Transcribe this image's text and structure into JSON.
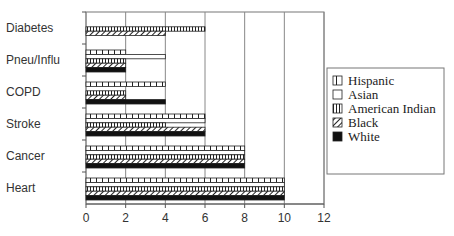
{
  "chart_data": {
    "type": "bar",
    "orientation": "horizontal",
    "title": "",
    "xlabel": "",
    "ylabel": "",
    "xlim": [
      0,
      12
    ],
    "xticks": [
      0,
      2,
      4,
      6,
      8,
      10,
      12
    ],
    "grid": true,
    "legend_position": "right",
    "categories": [
      "Diabetes",
      "Pneu/Influ",
      "COPD",
      "Stroke",
      "Cancer",
      "Heart"
    ],
    "series": [
      {
        "name": "Hispanic",
        "pattern": "vertical-bricks",
        "values": [
          0,
          2,
          4,
          6,
          8,
          10
        ]
      },
      {
        "name": "Asian",
        "pattern": "empty",
        "values": [
          0,
          4,
          0,
          6,
          8,
          10
        ]
      },
      {
        "name": "American Indian",
        "pattern": "vertical-lines",
        "values": [
          6,
          2,
          2,
          4,
          8,
          10
        ]
      },
      {
        "name": "Black",
        "pattern": "diagonal-hatch",
        "values": [
          4,
          2,
          2,
          6,
          8,
          10
        ]
      },
      {
        "name": "White",
        "pattern": "solid-black",
        "values": [
          0,
          2,
          4,
          6,
          8,
          10
        ]
      }
    ]
  },
  "legend": {
    "items": [
      {
        "label": "Hispanic"
      },
      {
        "label": "Asian"
      },
      {
        "label": "American Indian"
      },
      {
        "label": "Black"
      },
      {
        "label": "White"
      }
    ]
  }
}
